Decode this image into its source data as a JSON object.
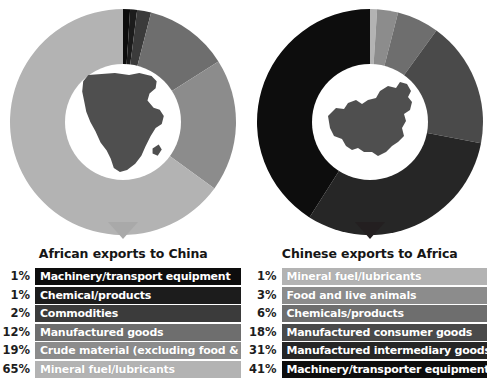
{
  "background": "#ffffff",
  "chart_data": [
    {
      "type": "pie",
      "title": "African exports to China",
      "subtitle": "",
      "xlabel": "",
      "ylabel": "",
      "unit": "%",
      "center_icon": "africa-map-silhouette",
      "legend_position": "below",
      "categories": [
        "Machinery/transport equipment",
        "Chemical/products",
        "Commodities",
        "Manufactured goods",
        "Crude material (excluding food & fuel)",
        "Mineral fuel/lubricants"
      ],
      "values": [
        1,
        1,
        2,
        12,
        19,
        65
      ],
      "labels": [
        "1%",
        "1%",
        "2%",
        "12%",
        "19%",
        "65%"
      ],
      "colors": [
        "#0d0d0d",
        "#1c1c1c",
        "#3b3b3b",
        "#6e6e6e",
        "#8c8c8c",
        "#b3b3b3"
      ],
      "pointer_color": "#a9a9a9"
    },
    {
      "type": "pie",
      "title": "Chinese exports to Africa",
      "subtitle": "",
      "xlabel": "",
      "ylabel": "",
      "unit": "%",
      "center_icon": "china-map-silhouette",
      "legend_position": "below",
      "categories": [
        "Mineral fuel/lubricants",
        "Food and live animals",
        "Chemicals/products",
        "Manufactured consumer goods",
        "Manufactured intermediary goods",
        "Machinery/transporter equipment"
      ],
      "values": [
        1,
        3,
        6,
        18,
        31,
        41
      ],
      "labels": [
        "1%",
        "3%",
        "6%",
        "18%",
        "31%",
        "41%"
      ],
      "colors": [
        "#b3b3b3",
        "#8c8c8c",
        "#6e6e6e",
        "#4a4a4a",
        "#262626",
        "#0d0d0d"
      ],
      "pointer_color": "#231f20"
    }
  ],
  "panels": [
    {
      "name": "african-exports-to-china",
      "title": "African exports to China",
      "map_icon": "africa-map-silhouette",
      "legend": [
        {
          "pct": "1%",
          "label": "Machinery/transport equipment",
          "color": "#0d0d0d"
        },
        {
          "pct": "1%",
          "label": "Chemical/products",
          "color": "#1c1c1c"
        },
        {
          "pct": "2%",
          "label": "Commodities",
          "color": "#3b3b3b"
        },
        {
          "pct": "12%",
          "label": "Manufactured goods",
          "color": "#6e6e6e"
        },
        {
          "pct": "19%",
          "label": "Crude material (excluding food & fuel)",
          "color": "#8c8c8c"
        },
        {
          "pct": "65%",
          "label": "Mineral fuel/lubricants",
          "color": "#b3b3b3"
        }
      ]
    },
    {
      "name": "chinese-exports-to-africa",
      "title": "Chinese exports to Africa",
      "map_icon": "china-map-silhouette",
      "legend": [
        {
          "pct": "1%",
          "label": "Mineral fuel/lubricants",
          "color": "#b3b3b3"
        },
        {
          "pct": "3%",
          "label": "Food and live animals",
          "color": "#8c8c8c"
        },
        {
          "pct": "6%",
          "label": "Chemicals/products",
          "color": "#6e6e6e"
        },
        {
          "pct": "18%",
          "label": "Manufactured consumer goods",
          "color": "#4a4a4a"
        },
        {
          "pct": "31%",
          "label": "Manufactured intermediary goods",
          "color": "#262626"
        },
        {
          "pct": "41%",
          "label": "Machinery/transporter equipment",
          "color": "#0d0d0d"
        }
      ]
    }
  ]
}
